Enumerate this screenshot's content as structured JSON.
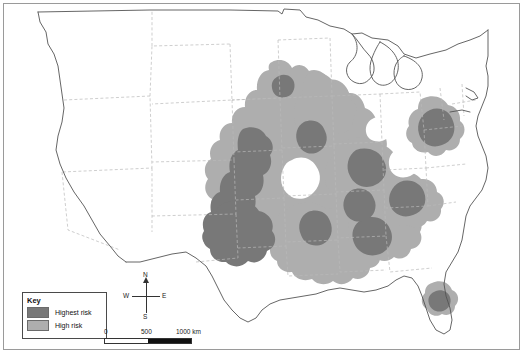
{
  "map": {
    "title": "United States severe weather risk map",
    "region": "Contiguous United States",
    "colors": {
      "highest_risk": "#787878",
      "high_risk": "#aeaeae",
      "no_risk": "#ffffff",
      "state_border": "#b9b9b9",
      "country_border": "#555555",
      "frame_border": "#9a9a9a"
    }
  },
  "legend": {
    "title": "Key",
    "items": [
      {
        "label": "Highest risk",
        "color": "#787878"
      },
      {
        "label": "High risk",
        "color": "#aeaeae"
      }
    ]
  },
  "compass": {
    "north": "N",
    "south": "S",
    "west": "W",
    "east": "E"
  },
  "scalebar": {
    "ticks": [
      "0",
      "500",
      "1000 km"
    ],
    "unit": "km",
    "max_value": "1000"
  }
}
